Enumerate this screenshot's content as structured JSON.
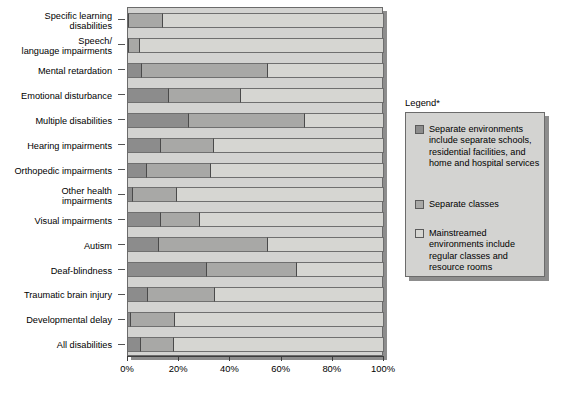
{
  "chart_data": {
    "type": "bar",
    "orientation": "horizontal",
    "stacked": true,
    "stacked_normalized": true,
    "title": "",
    "xlabel": "",
    "ylabel": "",
    "xlim": [
      0,
      100
    ],
    "xticks": [
      0,
      20,
      40,
      60,
      80,
      100
    ],
    "xtick_labels": [
      "0%",
      "20%",
      "40%",
      "60%",
      "80%",
      "100%"
    ],
    "grid": false,
    "legend_position": "right",
    "legend_title": "Legend*",
    "categories": [
      "Specific learning\ndisabilities",
      "Speech/\nlanguage impairments",
      "Mental retardation",
      "Emotional disturbance",
      "Multiple disabilities",
      "Hearing impairments",
      "Orthopedic impairments",
      "Other health\nimpairments",
      "Visual impairments",
      "Autism",
      "Deaf-blindness",
      "Traumatic brain injury",
      "Developmental delay",
      "All disabilities"
    ],
    "series": [
      {
        "name": "Separate environments include separate schools, residential facilities, and home and hospital services",
        "short_name": "Separate environments",
        "color": "#8c8c8c",
        "values": [
          0.5,
          0.5,
          5.5,
          16,
          24,
          13,
          7.5,
          2,
          13,
          12,
          31,
          8,
          1,
          5
        ]
      },
      {
        "name": "Separate classes",
        "short_name": "Separate classes",
        "color": "#a8a8a6",
        "values": [
          13,
          4,
          49,
          28,
          45,
          20.5,
          25,
          17,
          15,
          42.5,
          35,
          26,
          17.5,
          13
        ]
      },
      {
        "name": "Mainstreamed environments include regular classes and resource rooms",
        "short_name": "Mainstreamed environments",
        "color": "#d6d6d2",
        "values": [
          86.5,
          95.5,
          45.5,
          56,
          31,
          66.5,
          67.5,
          81,
          72,
          45.5,
          34,
          66,
          81.5,
          82
        ]
      }
    ]
  },
  "legend": {
    "title": "Legend*",
    "items": [
      {
        "swatch_color": "#8c8c8c",
        "label": "Separate environments\ninclude separate schools,\nresidential facilities, and\nhome and hospital services"
      },
      {
        "swatch_color": "#a8a8a6",
        "label": "Separate classes"
      },
      {
        "swatch_color": "#d6d6d2",
        "label": "Mainstreamed\nenvironments include\nregular classes and\nresource rooms"
      }
    ]
  }
}
